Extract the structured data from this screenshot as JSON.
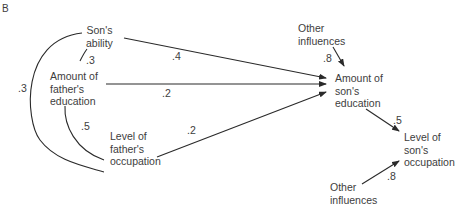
{
  "panel_label": "B",
  "nodes": {
    "sons_ability": [
      "Son's",
      "ability"
    ],
    "fathers_education": [
      "Amount of",
      "father's",
      "education"
    ],
    "fathers_occupation": [
      "Level of",
      "father's",
      "occupation"
    ],
    "other_influences_education": [
      "Other",
      "influences"
    ],
    "sons_education": [
      "Amount of",
      "son's",
      "education"
    ],
    "sons_occupation": [
      "Level of",
      "son's",
      "occupation"
    ],
    "other_influences_occupation": [
      "Other",
      "influences"
    ]
  },
  "correlations": {
    "ability_fathers_education": ".3",
    "fathers_education_fathers_occupation": ".5",
    "ability_fathers_occupation": ".3"
  },
  "paths": {
    "ability_to_sons_education": ".4",
    "fathers_education_to_sons_education": ".2",
    "fathers_occupation_to_sons_education": ".2",
    "other_to_sons_education": ".8",
    "sons_education_to_sons_occupation": ".5",
    "other_to_sons_occupation": ".8"
  },
  "colors": {
    "line": "#2a2a2a",
    "text": "#3d3d3d"
  }
}
